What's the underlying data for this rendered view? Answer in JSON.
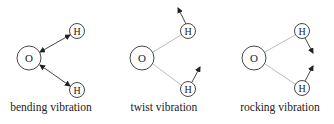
{
  "colors": {
    "stroke": "#333333",
    "bond": "#bbbbbb",
    "background": "#ffffff"
  },
  "panels": [
    {
      "caption": "bending vibration",
      "atoms": [
        {
          "label": "O"
        },
        {
          "label": "H"
        },
        {
          "label": "H"
        }
      ]
    },
    {
      "caption": "twist vibration",
      "atoms": [
        {
          "label": "O"
        },
        {
          "label": "H"
        },
        {
          "label": "H"
        }
      ]
    },
    {
      "caption": "rocking vibration",
      "atoms": [
        {
          "label": "O"
        },
        {
          "label": "H"
        },
        {
          "label": "H"
        }
      ]
    }
  ]
}
